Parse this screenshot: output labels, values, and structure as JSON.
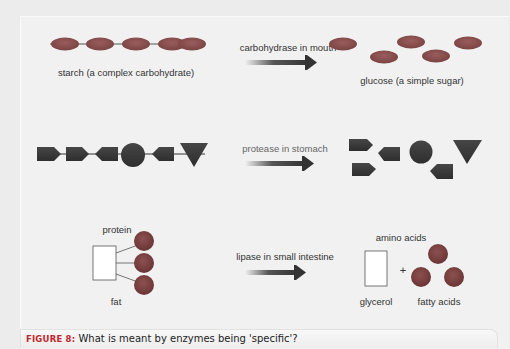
{
  "figure": {
    "caption_label": "FIGURE 8:",
    "caption_text": " What is meant by enzymes being 'specific'?"
  },
  "colors": {
    "oval_fill": "#8a5050",
    "shape_fill": "#3a3a3a",
    "background": "#f1f1f1",
    "caption_label": "#c1272d"
  },
  "rows": [
    {
      "enzyme_label": "carbohydrase in mouth",
      "substrate_label": "starch (a complex carbohydrate)",
      "product_label": "glucose (a simple sugar)"
    },
    {
      "enzyme_label": "protease in stomach",
      "substrate_label": "",
      "product_label": ""
    },
    {
      "enzyme_label": "lipase in small intestine",
      "substrate_label_top": "protein",
      "substrate_label_bottom": "fat",
      "product_label_top": "amino acids",
      "product_label_left": "glycerol",
      "product_label_right": "fatty acids",
      "plus_sign": "+"
    }
  ]
}
